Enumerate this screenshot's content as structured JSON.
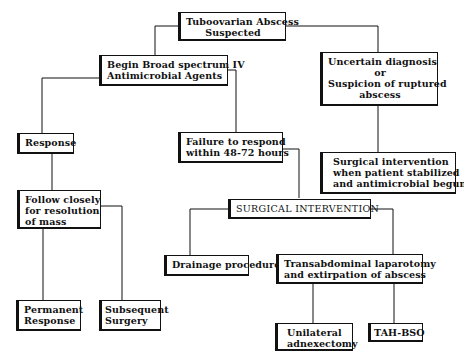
{
  "diagram": {
    "type": "flowchart",
    "nodes": {
      "start": {
        "lines": [
          "Tuboovarian Abscess",
          "Suspected"
        ]
      },
      "antimicrobial": {
        "lines": [
          "Begin Broad spectrum IV",
          "Antimicrobial Agents"
        ]
      },
      "uncertain": {
        "lines": [
          "Uncertain diagnosis",
          "or",
          "Suspicion of ruptured",
          "abscess"
        ]
      },
      "surgical_stabilized": {
        "lines": [
          "Surgical intervention",
          "when patient stabilized",
          "and antimicrobial begun"
        ]
      },
      "response": {
        "lines": [
          "Response"
        ]
      },
      "failure": {
        "lines": [
          "Failure to respond",
          "within 48-72 hours"
        ]
      },
      "surgical_intervention": {
        "lines": [
          "SURGICAL INTERVENTION"
        ]
      },
      "follow": {
        "lines": [
          "Follow closely",
          "for resolution",
          "of mass"
        ]
      },
      "drainage": {
        "lines": [
          "Drainage procedure"
        ]
      },
      "transabdominal": {
        "lines": [
          "Transabdominal laparotomy",
          "and extirpation of abscess"
        ]
      },
      "permanent": {
        "lines": [
          "Permanent",
          "Response"
        ]
      },
      "subsequent": {
        "lines": [
          "Subsequent",
          "Surgery"
        ]
      },
      "unilateral": {
        "lines": [
          "Unilateral",
          "adnexectomy"
        ]
      },
      "tahbso": {
        "lines": [
          "TAH-BSO"
        ]
      }
    },
    "edges": [
      [
        "start",
        "antimicrobial"
      ],
      [
        "start",
        "uncertain"
      ],
      [
        "uncertain",
        "surgical_stabilized"
      ],
      [
        "antimicrobial",
        "response"
      ],
      [
        "antimicrobial",
        "failure"
      ],
      [
        "response",
        "follow"
      ],
      [
        "failure",
        "surgical_intervention"
      ],
      [
        "follow",
        "permanent"
      ],
      [
        "follow",
        "subsequent"
      ],
      [
        "surgical_intervention",
        "drainage"
      ],
      [
        "surgical_intervention",
        "transabdominal"
      ],
      [
        "transabdominal",
        "unilateral"
      ],
      [
        "transabdominal",
        "tahbso"
      ]
    ]
  }
}
